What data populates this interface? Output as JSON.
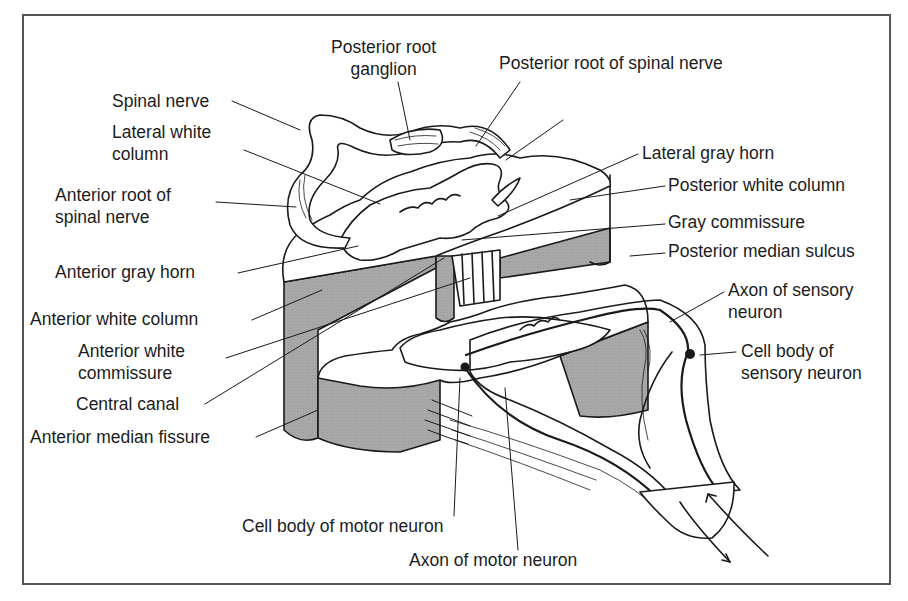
{
  "figure": {
    "fill_gray": "#a8a8a8",
    "line_color": "#1a1a1a",
    "frame_color": "#555555"
  },
  "labels": {
    "posterior_root_ganglion": "Posterior root\nganglion",
    "posterior_root_spinal_nerve": "Posterior root of spinal nerve",
    "spinal_nerve": "Spinal nerve",
    "lateral_white_column": "Lateral white\ncolumn",
    "anterior_root_spinal_nerve": "Anterior root of\nspinal nerve",
    "anterior_gray_horn": "Anterior gray horn",
    "anterior_white_column": "Anterior white column",
    "anterior_white_commissure": "Anterior white\ncommissure",
    "central_canal": "Central canal",
    "anterior_median_fissure": "Anterior median fissure",
    "lateral_gray_horn": "Lateral gray horn",
    "posterior_white_column": "Posterior white column",
    "gray_commissure": "Gray commissure",
    "posterior_median_sulcus": "Posterior median sulcus",
    "axon_sensory_neuron": "Axon of sensory\nneuron",
    "cell_body_sensory_neuron": "Cell body of\nsensory neuron",
    "cell_body_motor_neuron": "Cell body of motor neuron",
    "axon_motor_neuron": "Axon of motor neuron"
  }
}
